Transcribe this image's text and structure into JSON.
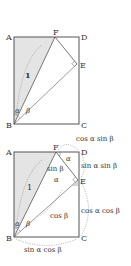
{
  "diagrams": [
    {
      "id": "top",
      "points": {
        "A": {
          "label": "A",
          "x": 14,
          "y": 37
        },
        "D": {
          "label": "D",
          "x": 79,
          "y": 37
        },
        "B": {
          "label": "B",
          "x": 14,
          "y": 124
        },
        "C": {
          "label": "C",
          "x": 79,
          "y": 124
        },
        "F": {
          "label": "F",
          "x": 55,
          "y": 37
        },
        "E": {
          "label": "E",
          "x": 77,
          "y": 64
        }
      },
      "labels": {
        "hyp": "1",
        "alpha": "α",
        "beta": "β"
      }
    },
    {
      "id": "bottom",
      "points": {
        "A": {
          "label": "A",
          "x": 14,
          "y": 152
        },
        "D": {
          "label": "D",
          "x": 79,
          "y": 152
        },
        "B": {
          "label": "B",
          "x": 14,
          "y": 237
        },
        "C": {
          "label": "C",
          "x": 79,
          "y": 237
        },
        "F": {
          "label": "F",
          "x": 56,
          "y": 152
        },
        "E": {
          "label": "E",
          "x": 78,
          "y": 180
        }
      },
      "labels": {
        "hyp": "1",
        "alpha": "α",
        "beta": "β",
        "alpha_at_F": "α",
        "alpha_at_E": "α",
        "FE": "sin β",
        "BE": "cos β",
        "FD": "cos α sin β",
        "DE": "sin α sin β",
        "EC": "cos α cos β",
        "BC": "sin α cos β"
      }
    }
  ],
  "colors": {
    "shade": "#e4e4e4",
    "line": "#555555",
    "dashed": "#777777"
  }
}
